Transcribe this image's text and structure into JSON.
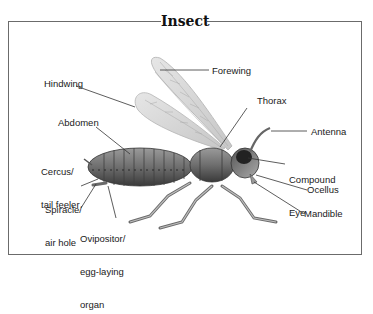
{
  "diagram": {
    "title": "Insect",
    "labels": {
      "forewing": "Forewing",
      "hindwing": "Hindwing",
      "thorax": "Thorax",
      "abdomen": "Abdomen",
      "antenna": "Antenna",
      "cercus_line1": "Cercus/",
      "cercus_line2": "tail feeler",
      "compound_eye_line1": "Compound",
      "compound_eye_line2": "Eye",
      "spiracle_line1": "Spiracle/",
      "spiracle_line2": "air hole",
      "ocellus": "Ocellus",
      "ovipositor_line1": "Ovipositor/",
      "ovipositor_line2": "egg-laying",
      "ovipositor_line3": "organ",
      "mandible": "Mandible"
    },
    "colors": {
      "frame": "#6b6b6b",
      "leader_line": "#333333",
      "body": "#7a7a7a",
      "wing": "#d8d8d8"
    }
  }
}
